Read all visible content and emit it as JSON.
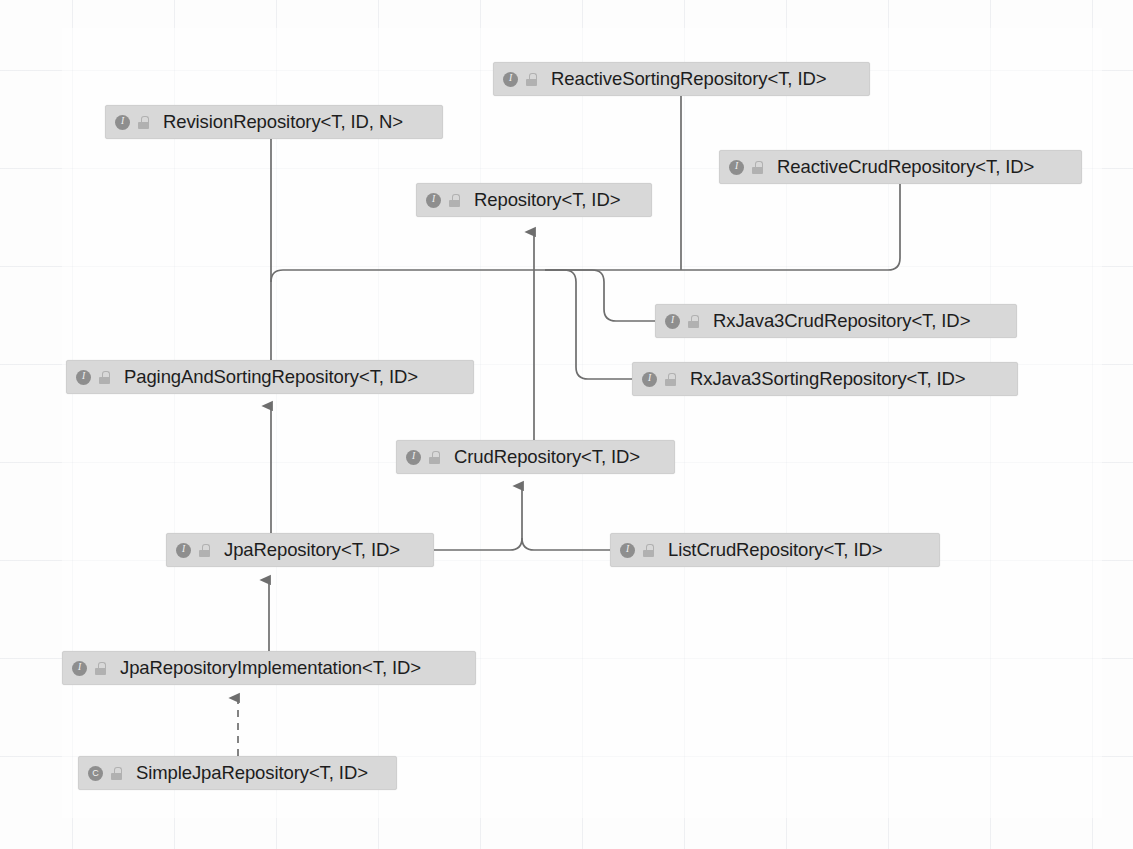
{
  "diagram": {
    "type": "uml-class-hierarchy",
    "background": "#fdfdfd",
    "node_fill": "#d8d8d8",
    "edge_color": "#6e6e6e",
    "icons": {
      "interface": "interface-icon",
      "class": "class-icon",
      "lock": "lock-icon"
    },
    "nodes": [
      {
        "id": "reactiveSorting",
        "label": "ReactiveSortingRepository<T, ID>",
        "kind": "I",
        "kind_letter": "I",
        "x": 493,
        "y": 62,
        "w": 377
      },
      {
        "id": "revision",
        "label": "RevisionRepository<T, ID, N>",
        "kind": "I",
        "kind_letter": "I",
        "x": 105,
        "y": 105,
        "w": 338
      },
      {
        "id": "reactiveCrud",
        "label": "ReactiveCrudRepository<T, ID>",
        "kind": "I",
        "kind_letter": "I",
        "x": 719,
        "y": 150,
        "w": 363
      },
      {
        "id": "repository",
        "label": "Repository<T, ID>",
        "kind": "I",
        "kind_letter": "I",
        "x": 416,
        "y": 183,
        "w": 236
      },
      {
        "id": "rxCrud",
        "label": "RxJava3CrudRepository<T, ID>",
        "kind": "I",
        "kind_letter": "I",
        "x": 655,
        "y": 304,
        "w": 362
      },
      {
        "id": "rxSorting",
        "label": "RxJava3SortingRepository<T, ID>",
        "kind": "I",
        "kind_letter": "I",
        "x": 632,
        "y": 362,
        "w": 386
      },
      {
        "id": "pagingAndSorting",
        "label": "PagingAndSortingRepository<T, ID>",
        "kind": "I",
        "kind_letter": "I",
        "x": 66,
        "y": 360,
        "w": 408
      },
      {
        "id": "crud",
        "label": "CrudRepository<T, ID>",
        "kind": "I",
        "kind_letter": "I",
        "x": 396,
        "y": 440,
        "w": 279
      },
      {
        "id": "jpa",
        "label": "JpaRepository<T, ID>",
        "kind": "I",
        "kind_letter": "I",
        "x": 166,
        "y": 533,
        "w": 268
      },
      {
        "id": "listCrud",
        "label": "ListCrudRepository<T, ID>",
        "kind": "I",
        "kind_letter": "I",
        "x": 610,
        "y": 533,
        "w": 330
      },
      {
        "id": "jpaImpl",
        "label": "JpaRepositoryImplementation<T, ID>",
        "kind": "I",
        "kind_letter": "I",
        "x": 62,
        "y": 651,
        "w": 414
      },
      {
        "id": "simpleJpa",
        "label": "SimpleJpaRepository<T, ID>",
        "kind": "C",
        "kind_letter": "C",
        "x": 78,
        "y": 756,
        "w": 319
      }
    ],
    "edges": [
      {
        "from": "revision",
        "to": "repository",
        "style": "solid",
        "relation": "extends"
      },
      {
        "from": "reactiveSorting",
        "to": "repository",
        "style": "solid",
        "relation": "extends"
      },
      {
        "from": "reactiveCrud",
        "to": "repository",
        "style": "solid",
        "relation": "extends"
      },
      {
        "from": "rxCrud",
        "to": "repository",
        "style": "solid",
        "relation": "extends"
      },
      {
        "from": "rxSorting",
        "to": "repository",
        "style": "solid",
        "relation": "extends"
      },
      {
        "from": "pagingAndSorting",
        "to": "repository",
        "style": "solid",
        "relation": "extends"
      },
      {
        "from": "crud",
        "to": "repository",
        "style": "solid",
        "relation": "extends"
      },
      {
        "from": "jpa",
        "to": "pagingAndSorting",
        "style": "solid",
        "relation": "extends"
      },
      {
        "from": "jpa",
        "to": "crud",
        "style": "solid",
        "relation": "extends"
      },
      {
        "from": "listCrud",
        "to": "crud",
        "style": "solid",
        "relation": "extends"
      },
      {
        "from": "jpaImpl",
        "to": "jpa",
        "style": "solid",
        "relation": "extends"
      },
      {
        "from": "simpleJpa",
        "to": "jpaImpl",
        "style": "dashed",
        "relation": "implements"
      }
    ]
  }
}
